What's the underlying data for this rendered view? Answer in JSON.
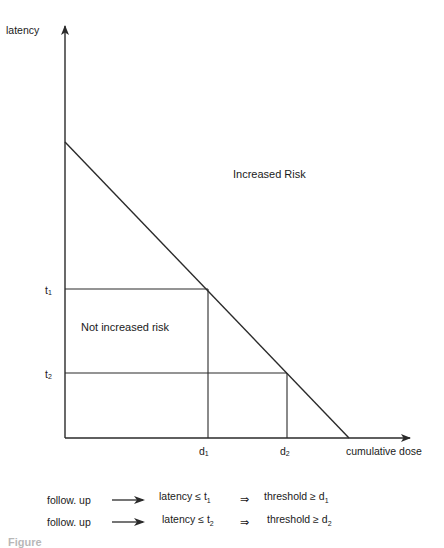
{
  "axes": {
    "y_label": "latency",
    "x_label": "cumulative dose"
  },
  "ticks": {
    "t1": {
      "base": "t",
      "sub": "1"
    },
    "t2": {
      "base": "t",
      "sub": "2"
    },
    "d1": {
      "base": "d",
      "sub": "1"
    },
    "d2": {
      "base": "d",
      "sub": "2"
    }
  },
  "regions": {
    "upper": "Increased Risk",
    "lower": "Not increased risk"
  },
  "rules": [
    {
      "condition": "follow. up",
      "arrow": "→",
      "latency": "latency ≤ ",
      "latency_sub_base": "t",
      "latency_sub": "1",
      "implies": "⇒",
      "threshold": "threshold ≥ ",
      "threshold_base": "d",
      "threshold_sub": "1"
    },
    {
      "condition": "follow. up",
      "arrow": "→",
      "latency": "latency ≤ ",
      "latency_sub_base": "t",
      "latency_sub": "2",
      "implies": "⇒",
      "threshold": "threshold ≥ ",
      "threshold_base": "d",
      "threshold_sub": "2"
    }
  ],
  "caption": "Figure",
  "colors": {
    "line": "#2a2a2a",
    "background": "#ffffff"
  }
}
